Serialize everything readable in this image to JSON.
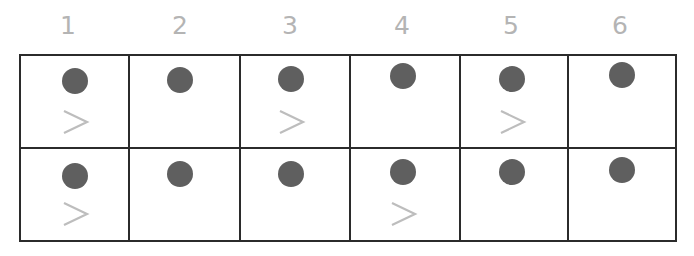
{
  "colors": {
    "dot": "#5f5f5f",
    "chevron": "#bdbdbd",
    "grid": "#2b2b2b",
    "label": "#b4b4b4"
  },
  "columns": [
    "1",
    "2",
    "3",
    "4",
    "5",
    "6"
  ],
  "rows": [
    [
      {
        "dot": true,
        "chevron": true
      },
      {
        "dot": true,
        "chevron": false
      },
      {
        "dot": true,
        "chevron": true
      },
      {
        "dot": true,
        "chevron": false
      },
      {
        "dot": true,
        "chevron": true
      },
      {
        "dot": true,
        "chevron": false
      }
    ],
    [
      {
        "dot": true,
        "chevron": true
      },
      {
        "dot": true,
        "chevron": false
      },
      {
        "dot": true,
        "chevron": false
      },
      {
        "dot": true,
        "chevron": true
      },
      {
        "dot": true,
        "chevron": false
      },
      {
        "dot": true,
        "chevron": false
      }
    ]
  ],
  "chevron_glyph": ">"
}
